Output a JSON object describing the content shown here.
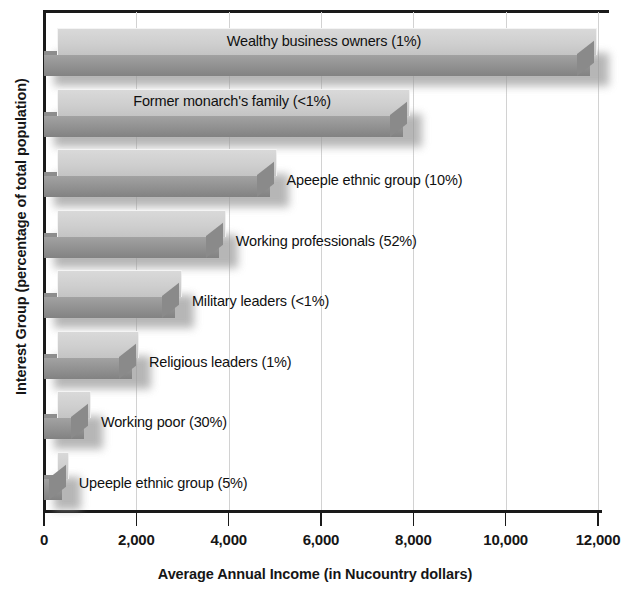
{
  "chart_data": {
    "type": "bar",
    "orientation": "horizontal",
    "title": "",
    "xlabel": "Average Annual Income (in Nucountry dollars)",
    "ylabel": "Interest Group (percentage of total population)",
    "xlim": [
      0,
      12000
    ],
    "xticks": [
      0,
      2000,
      4000,
      6000,
      8000,
      10000,
      12000
    ],
    "xtick_labels": [
      "0",
      "2,000",
      "4,000",
      "6,000",
      "8,000",
      "10,000",
      "12,000"
    ],
    "grid": true,
    "grid_axis": "x",
    "legend": false,
    "style": "3d-grayscale-bars",
    "categories": [
      "Wealthy business owners (1%)",
      "Former monarch's family (<1%)",
      "Apeeple ethnic group (10%)",
      "Working professionals (52%)",
      "Military leaders (<1%)",
      "Religious leaders (1%)",
      "Working poor (30%)",
      "Upeeple ethnic group (5%)"
    ],
    "values": [
      11900,
      7850,
      4950,
      3850,
      2900,
      1970,
      930,
      450
    ],
    "bars": [
      {
        "label": "Wealthy business owners (1%)",
        "group": "Wealthy business owners",
        "percent": "1%",
        "value": 11900,
        "label_placement": "inside"
      },
      {
        "label": "Former monarch's family (<1%)",
        "group": "Former monarch's family",
        "percent": "<1%",
        "value": 7850,
        "label_placement": "inside"
      },
      {
        "label": "Apeeple ethnic group (10%)",
        "group": "Apeeple ethnic group",
        "percent": "10%",
        "value": 4950,
        "label_placement": "outside"
      },
      {
        "label": "Working professionals (52%)",
        "group": "Working professionals",
        "percent": "52%",
        "value": 3850,
        "label_placement": "outside"
      },
      {
        "label": "Military leaders (<1%)",
        "group": "Military leaders",
        "percent": "<1%",
        "value": 2900,
        "label_placement": "outside"
      },
      {
        "label": "Religious leaders (1%)",
        "group": "Religious leaders",
        "percent": "1%",
        "value": 1970,
        "label_placement": "outside"
      },
      {
        "label": "Working poor (30%)",
        "group": "Working poor",
        "percent": "30%",
        "value": 930,
        "label_placement": "outside"
      },
      {
        "label": "Upeeple ethnic group (5%)",
        "group": "Upeeple ethnic group",
        "percent": "5%",
        "value": 450,
        "label_placement": "outside"
      }
    ],
    "colors": {
      "bar_top_face": "#cfcfcf",
      "bar_front_face": "#8f8f8f",
      "axis": "#1a1a1a",
      "gridline": "#d2d2d2",
      "text": "#161616",
      "background": "#ffffff"
    }
  }
}
